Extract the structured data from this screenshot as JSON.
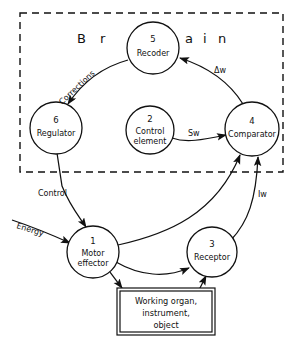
{
  "diagram": {
    "title_letters": [
      "B",
      "r",
      "a",
      "i",
      "n"
    ],
    "boundary_label": "Brain",
    "nodes": [
      {
        "id": "1",
        "number": "1",
        "label_line1": "Motor",
        "label_line2": "effector",
        "name": "motor-effector"
      },
      {
        "id": "2",
        "number": "2",
        "label_line1": "Control",
        "label_line2": "element",
        "name": "control-element"
      },
      {
        "id": "3",
        "number": "3",
        "label_line1": "Receptor",
        "label_line2": "",
        "name": "receptor"
      },
      {
        "id": "4",
        "number": "4",
        "label_line1": "Comparator",
        "label_line2": "",
        "name": "comparator"
      },
      {
        "id": "5",
        "number": "5",
        "label_line1": "Recoder",
        "label_line2": "",
        "name": "recoder"
      },
      {
        "id": "6",
        "number": "6",
        "label_line1": "Regulator",
        "label_line2": "",
        "name": "regulator"
      }
    ],
    "edge_labels": {
      "corrections": "Corrections",
      "delta_w": "Δw",
      "s_w": "Sw",
      "i_w": "Iw",
      "control": "Control",
      "energy": "Energy"
    },
    "terminal_box": {
      "line1": "Working organ,",
      "line2": "instrument,",
      "line3": "object"
    },
    "colors": {
      "stroke": "#111111",
      "background": "#ffffff"
    }
  }
}
